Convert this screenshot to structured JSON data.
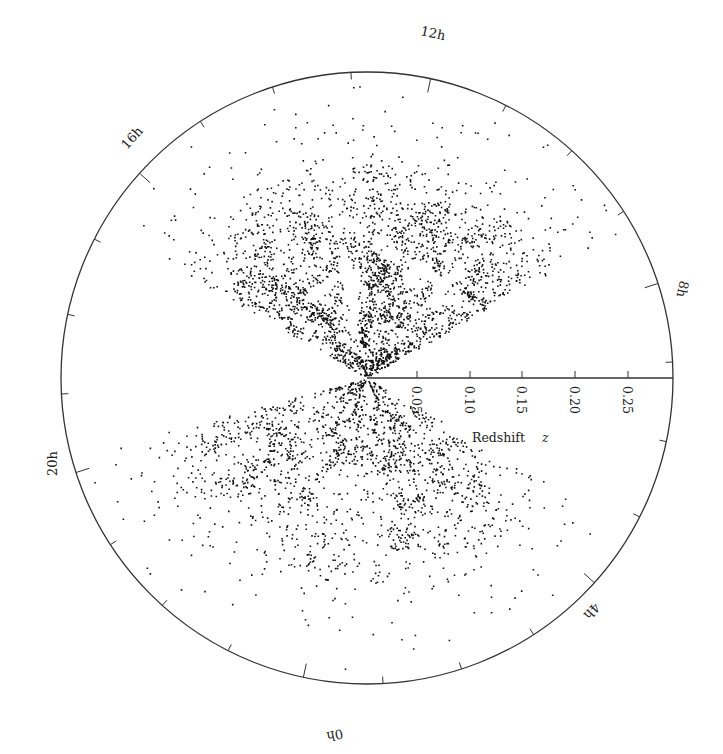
{
  "chart_data": {
    "type": "scatter",
    "subtype": "polar-cone-diagram",
    "title": "",
    "xlabel": "Redshift z",
    "radial_axis": {
      "label": "Redshift",
      "label_italic_symbol": "z",
      "ticks": [
        0.05,
        0.1,
        0.15,
        0.2,
        0.25
      ],
      "tick_labels": [
        "0.05",
        "0.10",
        "0.15",
        "0.20",
        "0.25"
      ],
      "range": [
        0,
        0.29
      ]
    },
    "angular_axis": {
      "unit": "hours (right ascension)",
      "labels": [
        {
          "text": "12h",
          "angle_deg": 78
        },
        {
          "text": "16h",
          "angle_deg": 138
        },
        {
          "text": "20h",
          "angle_deg": 198
        },
        {
          "text": "0h",
          "angle_deg": 258
        },
        {
          "text": "4h",
          "angle_deg": 318
        },
        {
          "text": "8h",
          "angle_deg": 18
        }
      ],
      "minor_tick_step_hours": 1
    },
    "series": [
      {
        "name": "northern-slice galaxies",
        "wedge_angle_deg": [
          30,
          150
        ],
        "zmax": 0.29,
        "density": "dense filaments near z<0.15, sparse beyond"
      },
      {
        "name": "southern-slice galaxies",
        "wedge_angle_deg": [
          195,
          330
        ],
        "zmax": 0.29,
        "density": "dense filaments near z<0.15, sparse beyond"
      }
    ],
    "colors": {
      "points": "#111111",
      "axes": "#333333",
      "background": "#ffffff"
    },
    "grid": false,
    "legend": null
  },
  "labels": {
    "h12": "12h",
    "h16": "16h",
    "h20": "20h",
    "h0": "0h",
    "h4": "4h",
    "h8": "8h",
    "t005": "0.05",
    "t010": "0.10",
    "t015": "0.15",
    "t020": "0.20",
    "t025": "0.25",
    "axis_title": "Redshift",
    "axis_symbol": "z"
  }
}
